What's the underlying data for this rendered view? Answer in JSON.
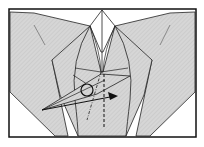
{
  "diagram": {
    "type": "origami-fold-step",
    "colors": {
      "paper": "#d4d4d4",
      "paper_hatch": "#c4c4c4",
      "paper_white": "#ffffff",
      "line": "#222222",
      "frame": "#111111"
    },
    "symbols": {
      "circle": "pivot-point",
      "arrow": "fold-direction-arrow",
      "dashed_line": "valley-fold-line",
      "dot_dash_line": "mountain-fold-line"
    }
  }
}
